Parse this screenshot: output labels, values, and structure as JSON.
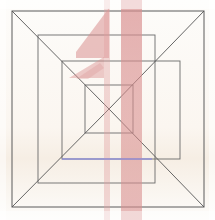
{
  "canvas": {
    "width": 215,
    "height": 220,
    "background_color": "#fdfcfa",
    "title": "Nested squares one-point perspective sketch"
  },
  "palette": {
    "line_color": "#5a5a5a",
    "line_color_soft": "#8a8a8a",
    "pink_overlay": "#d98f8f",
    "pink_overlay_faint": "#e8bcbc",
    "blue_line": "#8c8ce0",
    "background": "#fdfcfa",
    "vignette_warm": "#f7f1ea"
  },
  "figure": {
    "type": "line-drawing",
    "squares": [
      {
        "name": "outer-square",
        "x": 12,
        "y": 11,
        "width": 192,
        "height": 196,
        "stroke_width": 1.0
      },
      {
        "name": "second-square",
        "x": 38,
        "y": 35,
        "width": 117,
        "height": 148,
        "stroke_width": 0.9
      },
      {
        "name": "third-square",
        "x": 62,
        "y": 61,
        "width": 118,
        "height": 98,
        "stroke_width": 0.9
      },
      {
        "name": "inner-square",
        "x": 85,
        "y": 85,
        "width": 48,
        "height": 48,
        "stroke_width": 0.9
      }
    ],
    "diagonals": [
      {
        "name": "diagonal-top-left",
        "x1": 12,
        "y1": 11,
        "x2": 109,
        "y2": 109
      },
      {
        "name": "diagonal-top-right",
        "x1": 204,
        "y1": 11,
        "x2": 109,
        "y2": 109
      },
      {
        "name": "diagonal-bottom-left",
        "x1": 12,
        "y1": 207,
        "x2": 109,
        "y2": 109
      },
      {
        "name": "diagonal-bottom-right",
        "x1": 204,
        "y1": 207,
        "x2": 109,
        "y2": 109
      }
    ],
    "vanishing_point": {
      "x": 109,
      "y": 109,
      "label": "center vanishing point"
    },
    "accent_line": {
      "name": "blue-horizon-line",
      "x1": 62,
      "y1": 159,
      "x2": 152,
      "y2": 159,
      "color": "#8c8ce0",
      "stroke_width": 1.6
    }
  },
  "overlay_marks": {
    "description": "Translucent pink/red marker strokes drawn over the line sketch",
    "shapes": [
      {
        "name": "pink-band-wide",
        "type": "rect",
        "x": 121,
        "y": 0,
        "width": 21,
        "height": 220,
        "color": "#d98f8f",
        "opacity": 0.62
      },
      {
        "name": "pink-band-narrow",
        "type": "rect",
        "x": 104,
        "y": 0,
        "width": 6,
        "height": 220,
        "color": "#e0a0a0",
        "opacity": 0.42
      },
      {
        "name": "pink-parallelogram-upper",
        "type": "polygon",
        "points": "109,8 76,52 76,58 109,58",
        "color": "#d98f8f",
        "opacity": 0.58
      },
      {
        "name": "pink-parallelogram-lower",
        "type": "polygon",
        "points": "104,57 69,78 104,78",
        "color": "#d98f8f",
        "opacity": 0.52
      },
      {
        "name": "pink-slash-small",
        "type": "polygon",
        "points": "100,63 76,79 88,79 104,68",
        "color": "#dc9898",
        "opacity": 0.4
      }
    ]
  },
  "legend": {
    "visible": false,
    "entries": []
  }
}
